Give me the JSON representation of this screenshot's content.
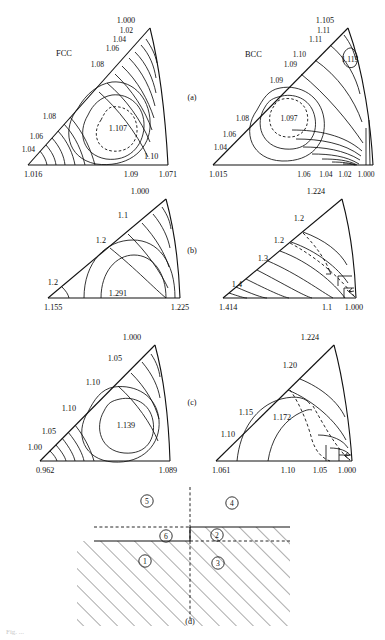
{
  "figure": {
    "caption_fragment": "Fig. ...",
    "panel_ids": [
      "(a)",
      "(b)",
      "(c)",
      "(d)"
    ]
  },
  "panels": {
    "a_fcc": {
      "name": "FCC",
      "panel_id": "(a)",
      "corner_labels": {
        "left": "1.016",
        "top": "1.000",
        "right": "1.071"
      },
      "edge_labels_hypotenuse": [
        "1.02",
        "1.04",
        "1.06",
        "1.08"
      ],
      "edge_labels_left_lower": [
        "1.08",
        "1.06",
        "1.04"
      ],
      "bottom_labels": [
        "1.09"
      ],
      "inner_labels": [
        "1.10"
      ],
      "max_label": "1.107"
    },
    "a_bcc": {
      "name": "BCC",
      "panel_id": "(a)",
      "corner_labels": {
        "left": "1.015",
        "top": "1.105",
        "right": "1.000"
      },
      "edge_labels_hypotenuse": [
        "1.11",
        "1.11",
        "1.10",
        "1.09",
        "1.09",
        "1.08",
        "1.06",
        "1.04"
      ],
      "bottom_labels": [
        "1.06",
        "1.04",
        "1.02",
        "1.000"
      ],
      "secondary_max_label": "1.113",
      "max_label": "1.097"
    },
    "b_left": {
      "panel_id": "(b)",
      "corner_labels": {
        "left": "1.155",
        "top": "1.000",
        "right": "1.225"
      },
      "edge_labels_hypotenuse": [
        "1.1",
        "1.2"
      ],
      "edge_labels_left_lower": [
        "1.2"
      ],
      "max_label": "1.291"
    },
    "b_right": {
      "panel_id": "(b)",
      "corner_labels": {
        "left": "1.414",
        "top": "1.224",
        "right": "1.000"
      },
      "edge_labels_hypotenuse": [
        "1.2",
        "1.2",
        "1.3",
        "1.4"
      ],
      "bottom_labels": [
        "1.1",
        "1.000"
      ]
    },
    "c_left": {
      "panel_id": "(c)",
      "corner_labels": {
        "left": "0.962",
        "top": "1.000",
        "right": "1.089"
      },
      "edge_labels_hypotenuse": [
        "1.05",
        "1.10",
        "1.10",
        "1.05",
        "1.00"
      ],
      "max_label": "1.139"
    },
    "c_right": {
      "panel_id": "(c)",
      "corner_labels": {
        "left": "1.061",
        "top": "1.224",
        "right": "1.000"
      },
      "edge_labels_hypotenuse": [
        "1.20",
        "1.15",
        "1.10"
      ],
      "bottom_labels": [
        "1.10",
        "1.05",
        "1.000"
      ],
      "max_label": "1.172"
    },
    "d": {
      "panel_id": "(d)",
      "region_numbers": [
        "1",
        "2",
        "3",
        "4",
        "5",
        "6"
      ]
    }
  },
  "colors": {
    "ink": "#111111",
    "background": "#ffffff"
  }
}
